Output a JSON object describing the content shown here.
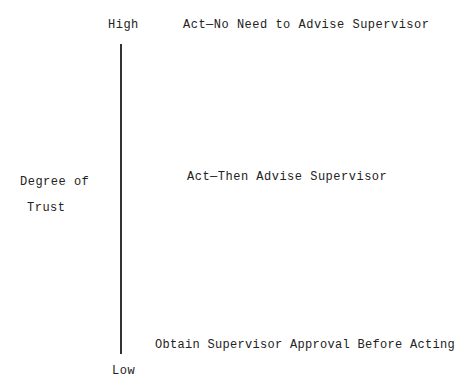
{
  "axis": {
    "title_line1": "Degree of",
    "title_line2": "Trust",
    "high_label": "High",
    "low_label": "Low"
  },
  "levels": [
    {
      "label": "Act—No Need to Advise Supervisor"
    },
    {
      "label": "Act—Then Advise Supervisor"
    },
    {
      "label": "Obtain Supervisor Approval Before Acting"
    }
  ]
}
